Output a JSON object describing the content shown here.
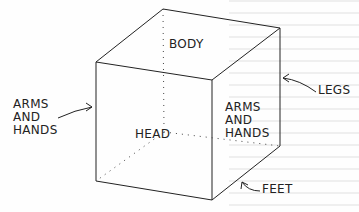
{
  "diagram": {
    "labels": {
      "body": "BODY",
      "head": "HEAD",
      "arms_left": "ARMS\nAND\nHANDS",
      "arms_right": "ARMS\nAND\nHANDS",
      "legs": "LEGS",
      "feet": "FEET"
    },
    "colors": {
      "line": "#222222",
      "background": "#fefefe"
    }
  }
}
